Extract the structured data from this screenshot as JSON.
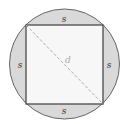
{
  "diagram": {
    "shape_labels": {
      "top": "s",
      "bottom": "s",
      "left": "s",
      "right": "s",
      "diagonal": "d"
    },
    "colors": {
      "circle_fill": "#d9d9d9",
      "square_fill": "#f7f7f7",
      "stroke": "#555555",
      "diagonal": "#aaaaaa"
    }
  }
}
